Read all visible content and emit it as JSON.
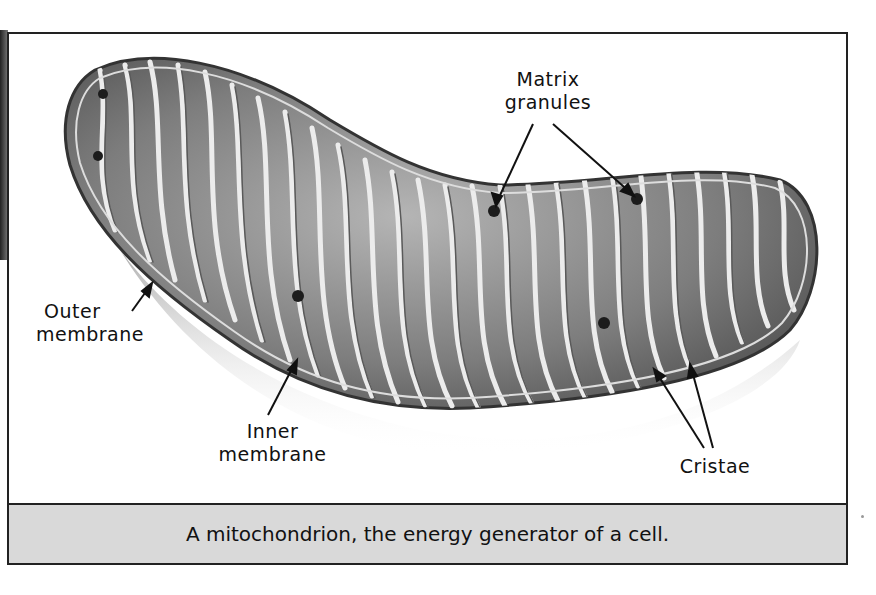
{
  "figure": {
    "caption": "A mitochondrion, the energy generator of a cell.",
    "labels": {
      "matrix_granules_line1": "Matrix",
      "matrix_granules_line2": "granules",
      "outer_membrane_line1": "Outer",
      "outer_membrane_line2": "membrane",
      "inner_membrane_line1": "Inner",
      "inner_membrane_line2": "membrane",
      "cristae": "Cristae"
    },
    "colors": {
      "frame_border": "#222222",
      "caption_background": "#d9d9d9",
      "organelle_fill": "#8a8a8a",
      "cristae_highlight": "#e8e8e8"
    }
  }
}
